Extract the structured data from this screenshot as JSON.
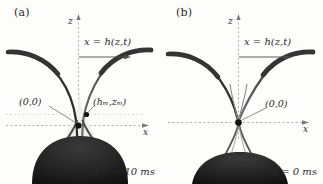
{
  "figure": {
    "width": 323,
    "height": 184,
    "background_color": "#fdfdfc",
    "ink_color": "#2b2b2b",
    "fluid_color": "#3a3a3a",
    "axis_color": "#9a9a9a"
  },
  "panels": [
    {
      "id": "a",
      "label": "(a)",
      "time_label": "t = − 10 ms",
      "equation_label": "x = h(z,t)",
      "axes": {
        "z_label": "z",
        "x_label": "x"
      },
      "points": [
        {
          "name": "origin",
          "label": "(0,0)"
        },
        {
          "name": "neck-minimum",
          "label": "(hₘ,zₘ)"
        }
      ]
    },
    {
      "id": "b",
      "label": "(b)",
      "time_label": "t = 0 ms",
      "equation_label": "x = h(z,t)",
      "axes": {
        "z_label": "z",
        "x_label": "x"
      },
      "points": [
        {
          "name": "origin",
          "label": "(0,0)"
        }
      ]
    }
  ]
}
